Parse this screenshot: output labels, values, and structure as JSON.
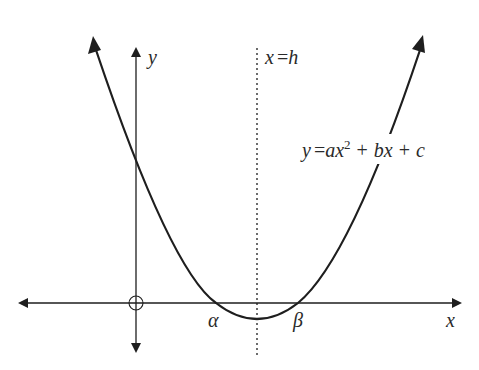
{
  "diagram": {
    "type": "parabola-graph",
    "labels": {
      "y_axis": "y",
      "x_axis": "x",
      "axis_of_symmetry": "x = h",
      "axis_of_symmetry_var": "x",
      "axis_of_symmetry_eq": "=",
      "axis_of_symmetry_val": "h",
      "equation_lhs": "y",
      "equation_eq": "=",
      "equation_a": "ax",
      "equation_exp": "2",
      "equation_plus1": "+",
      "equation_bx": "bx",
      "equation_plus2": "+",
      "equation_c": "c",
      "root_left": "α",
      "root_right": "β",
      "origin": "O"
    },
    "colors": {
      "stroke": "#1e1e1e",
      "background": "#ffffff"
    }
  }
}
